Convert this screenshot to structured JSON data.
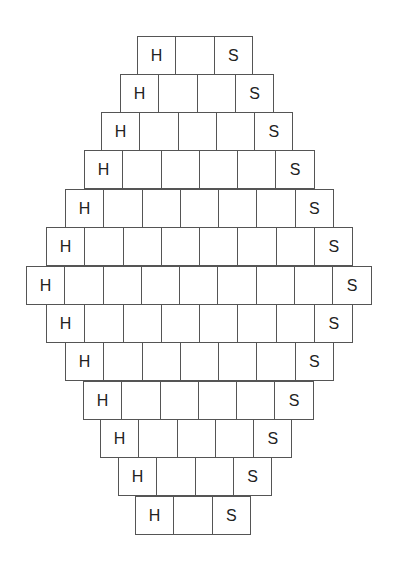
{
  "diagram": {
    "cell_width": 38.3,
    "row_height": 38.2,
    "line_color": "#555555",
    "text_color": "#222222",
    "rows": [
      {
        "left": 137,
        "top": 36,
        "cells": [
          "H",
          "",
          "S"
        ]
      },
      {
        "left": 120,
        "top": 74,
        "cells": [
          "H",
          "",
          "",
          "S"
        ]
      },
      {
        "left": 101,
        "top": 112,
        "cells": [
          "H",
          "",
          "",
          "",
          "S"
        ]
      },
      {
        "left": 84,
        "top": 150,
        "cells": [
          "H",
          "",
          "",
          "",
          "",
          "S"
        ]
      },
      {
        "left": 65,
        "top": 189,
        "cells": [
          "H",
          "",
          "",
          "",
          "",
          "",
          "S"
        ]
      },
      {
        "left": 46,
        "top": 227,
        "cells": [
          "H",
          "",
          "",
          "",
          "",
          "",
          "",
          "S"
        ]
      },
      {
        "left": 26,
        "top": 266,
        "cells": [
          "H",
          "",
          "",
          "",
          "",
          "",
          "",
          "",
          "S"
        ]
      },
      {
        "left": 46,
        "top": 304,
        "cells": [
          "H",
          "",
          "",
          "",
          "",
          "",
          "",
          "S"
        ]
      },
      {
        "left": 65,
        "top": 342,
        "cells": [
          "H",
          "",
          "",
          "",
          "",
          "",
          "S"
        ]
      },
      {
        "left": 83,
        "top": 381,
        "cells": [
          "H",
          "",
          "",
          "",
          "",
          "S"
        ]
      },
      {
        "left": 100,
        "top": 419,
        "cells": [
          "H",
          "",
          "",
          "",
          "S"
        ]
      },
      {
        "left": 118,
        "top": 457,
        "cells": [
          "H",
          "",
          "",
          "S"
        ]
      },
      {
        "left": 135,
        "top": 496,
        "cells": [
          "H",
          "",
          "S"
        ]
      }
    ]
  }
}
